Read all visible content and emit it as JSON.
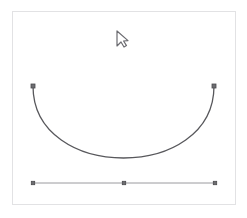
{
  "app": {
    "title": "Curve Editor Canvas",
    "background_color": "#ffffff"
  },
  "canvas": {
    "name": "drawing-canvas",
    "x": 12,
    "y": 11,
    "width": 224,
    "height": 194,
    "fill_color": "#ffffff",
    "border_color": "#e2e2e4",
    "border_width": 1
  },
  "shapes": {
    "curve": {
      "label": "bezier-curve",
      "type": "cubic-bezier",
      "stroke_color": "#58585c",
      "stroke_width": 1.3,
      "fill": "none",
      "start": {
        "x": 33,
        "y": 86
      },
      "control_1": {
        "x": 33,
        "y": 182
      },
      "control_2": {
        "x": 214,
        "y": 182
      },
      "end": {
        "x": 214,
        "y": 86
      },
      "path": "M 33 86 C 33 182 214 182 214 86"
    },
    "baseline": {
      "label": "horizontal-baseline",
      "type": "line",
      "stroke_color": "#9a9a9e",
      "stroke_width": 1,
      "start": {
        "x": 33,
        "y": 183
      },
      "end": {
        "x": 215,
        "y": 183
      }
    }
  },
  "anchor_points": [
    {
      "id": "curve-start-handle",
      "x": 33,
      "y": 86,
      "size": 4,
      "fill": "#6e6e72",
      "stroke": "#4a4a4e"
    },
    {
      "id": "curve-end-handle",
      "x": 214,
      "y": 86,
      "size": 4,
      "fill": "#6e6e72",
      "stroke": "#4a4a4e"
    },
    {
      "id": "baseline-start-point",
      "x": 33,
      "y": 183,
      "size": 3.4,
      "fill": "#6e6e72",
      "stroke": "#4a4a4e"
    },
    {
      "id": "baseline-mid-point",
      "x": 124,
      "y": 183,
      "size": 3.4,
      "fill": "#6e6e72",
      "stroke": "#4a4a4e"
    },
    {
      "id": "baseline-end-point",
      "x": 215,
      "y": 183,
      "size": 3.4,
      "fill": "#6e6e72",
      "stroke": "#4a4a4e"
    }
  ],
  "cursor": {
    "label": "mouse-pointer",
    "shape": "arrow-pointer-outline",
    "x": 117,
    "y": 31,
    "width": 11,
    "height": 16,
    "stroke_color": "#6b6b70",
    "fill_color": "#ffffff",
    "stroke_width": 1.2
  }
}
